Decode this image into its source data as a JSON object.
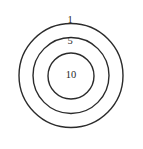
{
  "figure": {
    "background_color": "#ffffff",
    "stroke_color": "#2b2b2b",
    "label_color": "#1f1f1f"
  },
  "chart_data": {
    "type": "pie",
    "title": "",
    "subtitle": "",
    "xlabel": "",
    "ylabel": "",
    "grid": false,
    "legend": "none",
    "categories": [
      "outer-ring",
      "middle-ring",
      "inner-circle"
    ],
    "values": [
      1,
      5,
      10
    ],
    "labels": [
      "1",
      "5",
      "10"
    ],
    "rings": [
      {
        "name": "outer-ring",
        "label": "1",
        "value": 1,
        "center_x": 71,
        "center_y": 75.5,
        "radius": 52,
        "label_x": 70,
        "label_y": 21
      },
      {
        "name": "middle-ring",
        "label": "5",
        "value": 5,
        "center_x": 71,
        "center_y": 75.5,
        "radius": 38,
        "label_x": 70,
        "label_y": 42
      },
      {
        "name": "inner-circle",
        "label": "10",
        "value": 10,
        "center_x": 71,
        "center_y": 76,
        "radius": 23,
        "label_x": 71,
        "label_y": 76
      }
    ]
  }
}
